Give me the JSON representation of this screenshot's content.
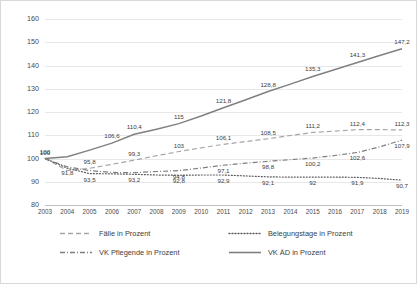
{
  "chart_data": {
    "type": "line",
    "title": "",
    "xlabel": "",
    "ylabel": "",
    "ylim": [
      80,
      160
    ],
    "yticks": [
      80,
      90,
      100,
      110,
      120,
      130,
      140,
      150,
      160
    ],
    "grid": true,
    "legend_position": "bottom",
    "categories": [
      "2003",
      "2004",
      "2005",
      "2006",
      "2007",
      "2008",
      "2009",
      "2010",
      "2011",
      "2012",
      "2013",
      "2014",
      "2015",
      "2016",
      "2017",
      "2018",
      "2019"
    ],
    "series": [
      {
        "name": "Fälle in Prozent",
        "style": "dashed",
        "color": "#a6a6a6",
        "values": [
          100,
          94.8,
          95.8,
          97.5,
          99.3,
          101.2,
          103,
          104.6,
          106.1,
          107.3,
          108.5,
          109.9,
          111.2,
          111.8,
          112.4,
          112.4,
          112.3
        ],
        "labels": [
          "100",
          "",
          "95,8",
          "",
          "99,3",
          "",
          "103",
          "",
          "106,1",
          "",
          "108,5",
          "",
          "111,2",
          "",
          "112,4",
          "",
          "112,3"
        ]
      },
      {
        "name": "Belegungstage in Prozent",
        "style": "dotted",
        "color": "#5a5a5a",
        "values": [
          100,
          95.8,
          93.5,
          93.4,
          93.2,
          92.9,
          92.8,
          92.9,
          92.9,
          92.5,
          92.1,
          92.0,
          92.0,
          92.0,
          91.9,
          91.4,
          90.7
        ],
        "labels": [
          "",
          "",
          "93,5",
          "",
          "93,2",
          "",
          "92,8",
          "",
          "92,9",
          "",
          "92,1",
          "",
          "92",
          "",
          "91,9",
          "",
          "90,7"
        ]
      },
      {
        "name": "VK Pflegende in Prozent",
        "style": "dashdot",
        "color": "#7f7f7f",
        "values": [
          100,
          96.4,
          94.8,
          94.0,
          93.9,
          94.4,
          94.8,
          95.9,
          97.1,
          98.0,
          98.8,
          99.5,
          100.2,
          101.3,
          102.6,
          105.0,
          107.9
        ],
        "labels": [
          "",
          "91,8",
          "",
          "",
          "",
          "",
          "94,8",
          "",
          "97,1",
          "",
          "98,8",
          "",
          "100,2",
          "",
          "102,6",
          "",
          "107,9"
        ]
      },
      {
        "name": "VK ÄD in Prozent",
        "style": "solid",
        "color": "#808080",
        "values": [
          100,
          100.8,
          103.6,
          106.6,
          110.4,
          112.6,
          115,
          118.3,
          121.8,
          125.3,
          128.8,
          132.0,
          135.3,
          138.3,
          141.3,
          144.3,
          147.2
        ],
        "labels": [
          "100",
          "",
          "",
          "106,6",
          "110,4",
          "",
          "115",
          "",
          "121,8",
          "",
          "128,8",
          "",
          "135,3",
          "",
          "141,3",
          "",
          "147,2"
        ]
      }
    ]
  },
  "legend": {
    "items": [
      {
        "label": "Fälle in Prozent",
        "style": "dashed"
      },
      {
        "label": "Belegungstage in Prozent",
        "style": "dotted"
      },
      {
        "label": "VK Pflegende in Prozent",
        "style": "dashdot"
      },
      {
        "label": "VK ÄD in Prozent",
        "style": "solid"
      }
    ]
  }
}
